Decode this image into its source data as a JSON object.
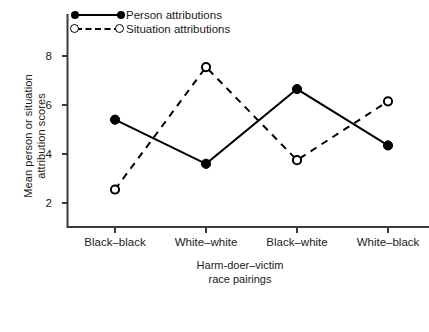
{
  "chart_data": {
    "type": "line",
    "title": "",
    "xlabel": "Harm-doer–victim race pairings",
    "xlabel_lines": [
      "Harm-doer–victim",
      "race pairings"
    ],
    "ylabel": "Mean person or situation attribution scores",
    "ylabel_lines": [
      "Mean person or situation",
      "attribution scores"
    ],
    "categories": [
      "Black–black",
      "White–white",
      "Black–white",
      "White–black"
    ],
    "series": [
      {
        "name": "Person attributions",
        "marker": "filled-circle",
        "line_style": "solid",
        "values": [
          5.4,
          3.6,
          6.65,
          4.35
        ]
      },
      {
        "name": "Situation attributions",
        "marker": "open-circle",
        "line_style": "dashed",
        "values": [
          2.55,
          7.55,
          3.75,
          6.15
        ]
      }
    ],
    "yticks": [
      2,
      4,
      6,
      8
    ],
    "ylim": [
      0.6,
      9.2
    ],
    "grid": false,
    "legend_position": "top-left",
    "colors": {
      "line": "#000000",
      "axis": "#3a3a3a",
      "background": "#ffffff"
    }
  },
  "legend": {
    "entries": [
      {
        "label": "Person attributions",
        "style": "solid-filled"
      },
      {
        "label": "Situation attributions",
        "style": "dashed-open"
      }
    ]
  },
  "axes": {
    "y_tick_labels": [
      "8",
      "6",
      "4",
      "2"
    ],
    "x_tick_labels": [
      "Black–black",
      "White–white",
      "Black–white",
      "White–black"
    ]
  }
}
